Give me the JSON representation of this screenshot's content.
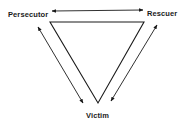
{
  "diagram": {
    "title": "",
    "type": "drama-triangle",
    "nodes": {
      "persecutor": {
        "label": "Persecutor"
      },
      "rescuer": {
        "label": "Rescuer"
      },
      "victim": {
        "label": "Victim"
      }
    },
    "edges": [
      {
        "from": "persecutor",
        "to": "rescuer",
        "style": "double-arrow"
      },
      {
        "from": "persecutor",
        "to": "victim",
        "style": "double-arrow"
      },
      {
        "from": "rescuer",
        "to": "victim",
        "style": "double-arrow"
      }
    ],
    "colors": {
      "line": "#1a1a1a",
      "background": "#ffffff"
    }
  }
}
